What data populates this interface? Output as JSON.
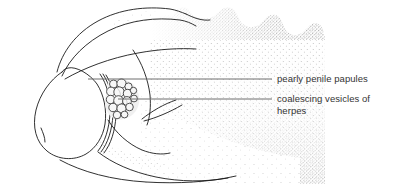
{
  "figure": {
    "background_color": "#ffffff",
    "ink_color": "#1a1a1a",
    "stipple_color": "#5a5a5a",
    "leader_line_color": "#6e6e6e",
    "text_color": "#343434",
    "width": 399,
    "height": 184
  },
  "labels": [
    {
      "id": "papules",
      "text": "pearly penile papules",
      "leader": {
        "x1": 88,
        "y1": 79,
        "x2": 272,
        "y2": 79
      }
    },
    {
      "id": "herpes",
      "text": "coalescing vesicles of\nherpes",
      "leader": {
        "x1": 118,
        "y1": 99,
        "x2": 272,
        "y2": 99
      }
    }
  ],
  "anatomy": {
    "parts": [
      "glans",
      "coronal-sulcus",
      "shaft",
      "foreskin-fold",
      "scrotum-edge"
    ],
    "lesion_cluster": {
      "name": "coalescing-vesicles",
      "count": 16,
      "circles": [
        {
          "cx": 113.5,
          "cy": 84.0,
          "r": 4.0
        },
        {
          "cx": 121.5,
          "cy": 83.5,
          "r": 4.6
        },
        {
          "cx": 128.5,
          "cy": 86.5,
          "r": 3.6
        },
        {
          "cx": 111.0,
          "cy": 91.5,
          "r": 4.4
        },
        {
          "cx": 119.0,
          "cy": 92.0,
          "r": 5.2
        },
        {
          "cx": 127.5,
          "cy": 93.5,
          "r": 4.2
        },
        {
          "cx": 133.5,
          "cy": 90.5,
          "r": 3.2
        },
        {
          "cx": 110.5,
          "cy": 99.5,
          "r": 4.2
        },
        {
          "cx": 118.5,
          "cy": 100.5,
          "r": 4.8
        },
        {
          "cx": 127.0,
          "cy": 101.0,
          "r": 4.4
        },
        {
          "cx": 134.0,
          "cy": 98.5,
          "r": 3.4
        },
        {
          "cx": 113.0,
          "cy": 107.5,
          "r": 4.2
        },
        {
          "cx": 121.5,
          "cy": 108.5,
          "r": 4.6
        },
        {
          "cx": 129.5,
          "cy": 107.0,
          "r": 3.8
        },
        {
          "cx": 117.0,
          "cy": 115.0,
          "r": 3.8
        },
        {
          "cx": 124.5,
          "cy": 114.5,
          "r": 3.4
        }
      ]
    },
    "stipple_region": {
      "name": "shaded-shaft-skin",
      "description": "dense stipple fading to the left and bottom"
    }
  }
}
